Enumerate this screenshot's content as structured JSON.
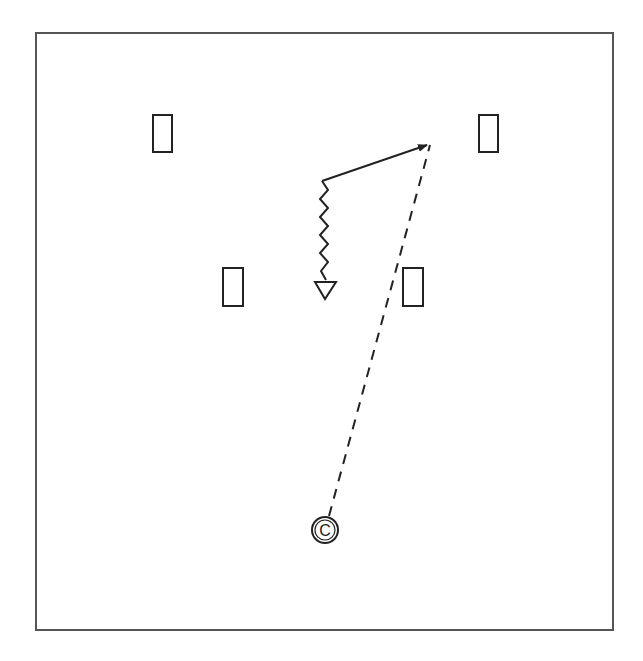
{
  "diagram": {
    "colors": {
      "stroke": "#222222",
      "frame": "#555555",
      "background": "#ffffff"
    },
    "frame": {
      "x": 36,
      "y": 33,
      "width": 577,
      "height": 597
    },
    "players": [
      {
        "id": "player-1",
        "shape": "rectangle",
        "x": 153,
        "y": 115,
        "w": 19,
        "h": 37
      },
      {
        "id": "player-2",
        "shape": "rectangle",
        "x": 479,
        "y": 115,
        "w": 19,
        "h": 37
      },
      {
        "id": "player-3",
        "shape": "rectangle",
        "x": 223,
        "y": 268,
        "w": 20,
        "h": 38
      },
      {
        "id": "player-4",
        "shape": "rectangle",
        "x": 403,
        "y": 268,
        "w": 20,
        "h": 38
      }
    ],
    "center": {
      "label": "C",
      "x": 325,
      "y": 530,
      "r": 13
    },
    "defender": {
      "shape": "triangle-down",
      "x": 325,
      "y": 282
    },
    "paths": {
      "pass": {
        "style": "dashed",
        "from": [
          329,
          516
        ],
        "to": [
          430,
          145
        ]
      },
      "cut": {
        "style": "solid-arrow",
        "from": [
          322,
          181
        ],
        "to": [
          427,
          145
        ]
      },
      "dribble": {
        "style": "zigzag",
        "from": [
          322,
          181
        ],
        "to": [
          326,
          280
        ]
      }
    }
  }
}
